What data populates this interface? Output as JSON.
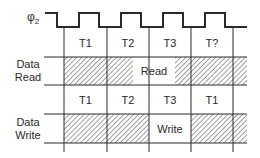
{
  "signal": {
    "name": "φ",
    "subscript": "2"
  },
  "rows": {
    "read": {
      "label_line1": "Data",
      "label_line2": "Read",
      "window_label": "Read"
    },
    "write": {
      "label_line1": "Data",
      "label_line2": "Write",
      "window_label": "Write"
    }
  },
  "read_cycle_states": [
    "T1",
    "T2",
    "T3",
    "T?"
  ],
  "write_cycle_states": [
    "T1",
    "T2",
    "T3",
    "T1"
  ],
  "colors": {
    "line": "#2a2a2a",
    "hatch": "#555555",
    "background": "#ffffff"
  }
}
